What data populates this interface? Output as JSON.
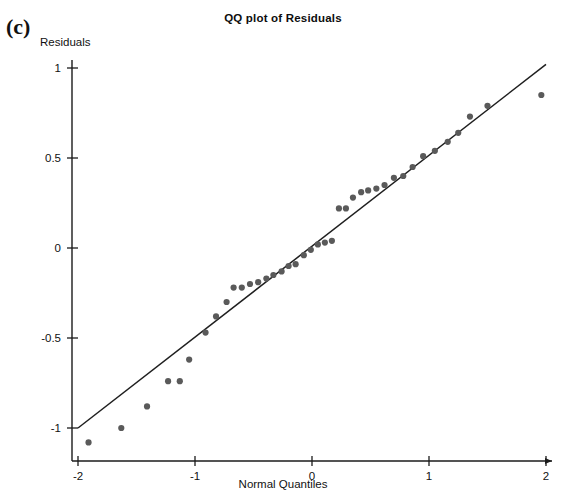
{
  "figure": {
    "panel_label": "(c)",
    "title": "QQ plot of Residuals",
    "y_axis_caption": "Residuals",
    "x_axis_caption": "Normal Quantiles"
  },
  "colors": {
    "point": "#5a5a5a",
    "line": "#1f1f1f",
    "axis": "#1b1b1b",
    "text": "#111111",
    "background": "#ffffff"
  },
  "chart_data": {
    "type": "scatter",
    "title": "QQ plot of Residuals",
    "xlabel": "Normal Quantiles",
    "ylabel": "Residuals",
    "xlim": [
      -2.0,
      2.0
    ],
    "ylim": [
      -1.15,
      1.05
    ],
    "xticks": [
      -2,
      -1,
      0,
      1,
      2
    ],
    "xtick_labels": [
      "-2",
      "-1",
      "0",
      "1",
      "2"
    ],
    "yticks": [
      -1,
      -0.5,
      0,
      0.5,
      1
    ],
    "ytick_labels": [
      "-1",
      "-0.5",
      "0",
      "0.5",
      "1"
    ],
    "grid": false,
    "legend": false,
    "series": [
      {
        "name": "Residual quantiles",
        "marker": "circle",
        "points": [
          [
            -1.91,
            -1.08
          ],
          [
            -1.63,
            -1.0
          ],
          [
            -1.41,
            -0.88
          ],
          [
            -1.23,
            -0.74
          ],
          [
            -1.13,
            -0.74
          ],
          [
            -1.05,
            -0.62
          ],
          [
            -0.91,
            -0.47
          ],
          [
            -0.82,
            -0.38
          ],
          [
            -0.73,
            -0.3
          ],
          [
            -0.67,
            -0.22
          ],
          [
            -0.6,
            -0.22
          ],
          [
            -0.53,
            -0.2
          ],
          [
            -0.46,
            -0.19
          ],
          [
            -0.39,
            -0.17
          ],
          [
            -0.33,
            -0.15
          ],
          [
            -0.26,
            -0.13
          ],
          [
            -0.2,
            -0.1
          ],
          [
            -0.14,
            -0.09
          ],
          [
            -0.07,
            -0.04
          ],
          [
            -0.01,
            -0.01
          ],
          [
            0.05,
            0.02
          ],
          [
            0.11,
            0.03
          ],
          [
            0.17,
            0.04
          ],
          [
            0.23,
            0.22
          ],
          [
            0.29,
            0.22
          ],
          [
            0.35,
            0.28
          ],
          [
            0.42,
            0.31
          ],
          [
            0.48,
            0.32
          ],
          [
            0.55,
            0.33
          ],
          [
            0.62,
            0.35
          ],
          [
            0.7,
            0.39
          ],
          [
            0.78,
            0.4
          ],
          [
            0.86,
            0.45
          ],
          [
            0.95,
            0.51
          ],
          [
            1.05,
            0.54
          ],
          [
            1.16,
            0.59
          ],
          [
            1.25,
            0.64
          ],
          [
            1.35,
            0.73
          ],
          [
            1.5,
            0.79
          ],
          [
            1.96,
            0.85
          ]
        ]
      }
    ],
    "reference_line": {
      "name": "Normal reference line",
      "x_start": -2.0,
      "y_start": -1.0,
      "x_end": 2.0,
      "y_end": 1.02
    }
  }
}
